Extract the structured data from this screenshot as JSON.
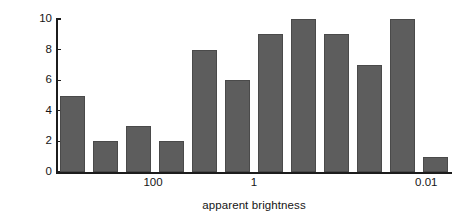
{
  "chart_data": {
    "type": "bar",
    "title": "",
    "xlabel": "apparent brightness",
    "ylabel": "number of stars",
    "values": [
      5,
      2,
      3,
      2,
      8,
      6,
      9,
      10,
      9,
      7,
      10,
      1
    ],
    "categories": [
      "1",
      "2",
      "3",
      "4",
      "5",
      "6",
      "7",
      "8",
      "9",
      "10",
      "11",
      "12"
    ],
    "ylim": [
      0,
      10
    ],
    "y_ticks": [
      0,
      2,
      4,
      6,
      8,
      10
    ],
    "y_tick_labels": [
      "0",
      "2",
      "4",
      "6",
      "8",
      "10"
    ],
    "x_tick_labels": [
      "100",
      "1",
      "0.01"
    ],
    "x_tick_positions_pct": [
      24.5,
      50.0,
      93.5
    ],
    "x_scale": "log-descending",
    "grid": false,
    "legend": null,
    "bar_color": "#5d5d5d",
    "bar_edge_color": "#4a4a4a",
    "axis_color": "#1c1c1c",
    "background_color": "#ffffff"
  }
}
